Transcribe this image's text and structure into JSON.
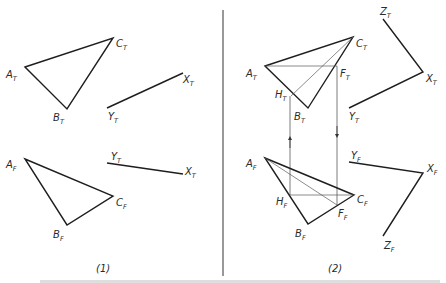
{
  "figure": {
    "panels": [
      {
        "label": "(1)",
        "top_triangle": {
          "A": "A",
          "A_sub": "T",
          "B": "B",
          "B_sub": "T",
          "C": "C",
          "C_sub": "T"
        },
        "top_line": {
          "Y": "Y",
          "Y_sub": "T",
          "X": "X",
          "X_sub": "T"
        },
        "front_triangle": {
          "A": "A",
          "A_sub": "F",
          "B": "B",
          "B_sub": "F",
          "C": "C",
          "C_sub": "F"
        },
        "front_line": {
          "Y": "Y",
          "Y_sub": "T",
          "X": "X",
          "X_sub": "T"
        }
      },
      {
        "label": "(2)",
        "top_triangle": {
          "A": "A",
          "A_sub": "T",
          "B": "B",
          "B_sub": "T",
          "C": "C",
          "C_sub": "T",
          "F": "F",
          "F_sub": "T",
          "H": "H",
          "H_sub": "T"
        },
        "top_axes": {
          "Z": "Z",
          "Z_sub": "T",
          "X": "X",
          "X_sub": "T",
          "Y": "Y",
          "Y_sub": "T"
        },
        "front_triangle": {
          "A": "A",
          "A_sub": "F",
          "B": "B",
          "B_sub": "F",
          "C": "C",
          "C_sub": "F",
          "F": "F",
          "F_sub": "F",
          "H": "H",
          "H_sub": "F"
        },
        "front_axes": {
          "Y": "Y",
          "Y_sub": "F",
          "X": "X",
          "X_sub": "F",
          "Z": "Z",
          "Z_sub": "F"
        }
      }
    ],
    "line_color": "#1e1e1e",
    "construction_color": "#5a5a5a"
  }
}
